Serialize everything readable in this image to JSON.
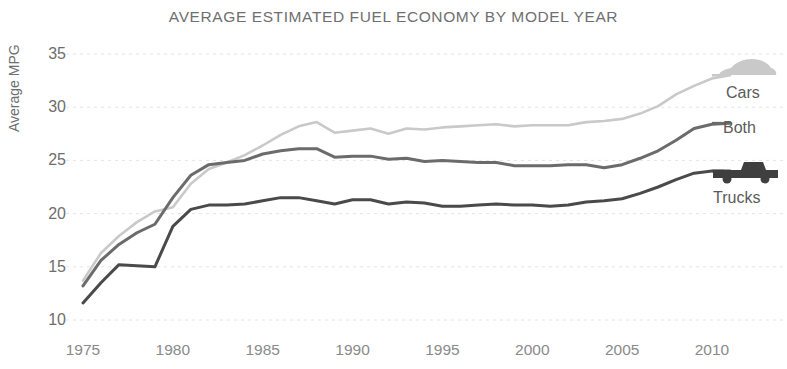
{
  "chart_data": {
    "type": "line",
    "title": "AVERAGE ESTIMATED FUEL ECONOMY BY MODEL YEAR",
    "xlabel": "",
    "ylabel": "Average MPG",
    "xlim": [
      1974.2,
      2011.6
    ],
    "ylim": [
      9.2,
      36.2
    ],
    "grid": true,
    "grid_axis": "y",
    "legend_position": "right-inline",
    "xticks": [
      1975,
      1980,
      1985,
      1990,
      1995,
      2000,
      2005,
      2010
    ],
    "yticks": [
      10,
      15,
      20,
      25,
      30,
      35
    ],
    "x": [
      1975,
      1976,
      1977,
      1978,
      1979,
      1980,
      1981,
      1982,
      1983,
      1984,
      1985,
      1986,
      1987,
      1988,
      1989,
      1990,
      1991,
      1992,
      1993,
      1994,
      1995,
      1996,
      1997,
      1998,
      1999,
      2000,
      2001,
      2002,
      2003,
      2004,
      2005,
      2006,
      2007,
      2008,
      2009,
      2010,
      2011
    ],
    "series": [
      {
        "name": "Cars",
        "color": "#c9c9c9",
        "icon": "car-icon",
        "values": [
          13.7,
          16.3,
          17.9,
          19.2,
          20.2,
          20.6,
          22.8,
          24.2,
          24.8,
          25.5,
          26.4,
          27.4,
          28.2,
          28.6,
          27.6,
          27.8,
          28.0,
          27.5,
          28.0,
          27.9,
          28.1,
          28.2,
          28.3,
          28.4,
          28.2,
          28.3,
          28.3,
          28.3,
          28.6,
          28.7,
          28.9,
          29.4,
          30.1,
          31.2,
          32.0,
          32.7,
          33.0
        ]
      },
      {
        "name": "Both",
        "color": "#6b6b6b",
        "icon": null,
        "values": [
          13.2,
          15.6,
          17.1,
          18.2,
          19.0,
          21.5,
          23.6,
          24.6,
          24.8,
          25.0,
          25.6,
          25.9,
          26.1,
          26.1,
          25.3,
          25.4,
          25.4,
          25.1,
          25.2,
          24.9,
          25.0,
          24.9,
          24.8,
          24.8,
          24.5,
          24.5,
          24.5,
          24.6,
          24.6,
          24.3,
          24.6,
          25.2,
          25.9,
          26.9,
          28.0,
          28.4,
          28.5
        ]
      },
      {
        "name": "Trucks",
        "color": "#4a4a4a",
        "icon": "truck-icon",
        "values": [
          11.6,
          13.5,
          15.2,
          15.1,
          15.0,
          18.8,
          20.4,
          20.8,
          20.8,
          20.9,
          21.2,
          21.5,
          21.5,
          21.2,
          20.9,
          21.3,
          21.3,
          20.9,
          21.1,
          21.0,
          20.7,
          20.7,
          20.8,
          20.9,
          20.8,
          20.8,
          20.7,
          20.8,
          21.1,
          21.2,
          21.4,
          21.9,
          22.5,
          23.2,
          23.8,
          24.0,
          24.0
        ]
      }
    ]
  },
  "axis": {
    "y_title": "Average MPG",
    "y_ticks": [
      "35",
      "30",
      "25",
      "20",
      "15",
      "10"
    ],
    "x_ticks": [
      "1975",
      "1980",
      "1985",
      "1990",
      "1995",
      "2000",
      "2005",
      "2010"
    ]
  },
  "legend": {
    "cars_label": "Cars",
    "both_label": "Both",
    "trucks_label": "Trucks",
    "car_icon_name": "car-icon",
    "truck_icon_name": "truck-icon"
  },
  "header": {
    "title": "AVERAGE ESTIMATED FUEL ECONOMY BY MODEL YEAR"
  },
  "colors": {
    "cars": "#c9c9c9",
    "both": "#6b6b6b",
    "trucks": "#4a4a4a",
    "grid": "#e4e4e4",
    "text": "#6e6e6e",
    "background": "#ffffff"
  }
}
